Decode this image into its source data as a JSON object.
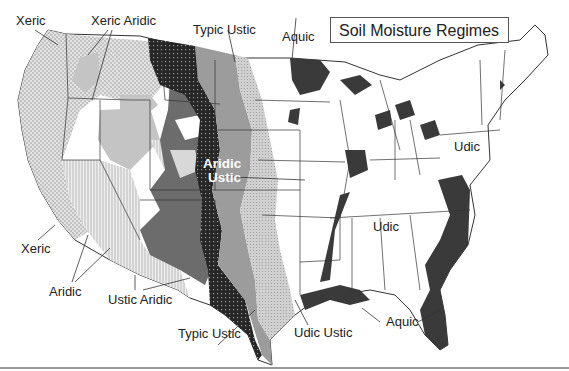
{
  "title": "Soil Moisture Regimes",
  "map": {
    "region": "Contiguous United States",
    "legend_colors": {
      "xeric": "#dcdcdc",
      "xeric_aridic": "#bdbdbd",
      "aridic": "#e6e6e6",
      "ustic_aridic": "#6e6e6e",
      "aridic_ustic": "#2e2e2e",
      "typic_ustic": "#9a9a9a",
      "udic_ustic": "#c8c8c8",
      "udic": "#ffffff",
      "aquic": "#3a3a3a",
      "state_lines": "#333333"
    },
    "labels": [
      {
        "id": "xeric-nw",
        "text": "Xeric"
      },
      {
        "id": "xeric-aridic",
        "text": "Xeric Aridic"
      },
      {
        "id": "typic-ustic-north",
        "text": "Typic Ustic"
      },
      {
        "id": "aquic-north",
        "text": "Aquic"
      },
      {
        "id": "aridic-ustic-1",
        "text": "Aridic"
      },
      {
        "id": "aridic-ustic-2",
        "text": "Ustic"
      },
      {
        "id": "udic-pa",
        "text": "Udic"
      },
      {
        "id": "udic-south",
        "text": "Udic"
      },
      {
        "id": "xeric-ca",
        "text": "Xeric"
      },
      {
        "id": "aridic-sw",
        "text": "Aridic"
      },
      {
        "id": "ustic-aridic",
        "text": "Ustic Aridic"
      },
      {
        "id": "typic-ustic-south",
        "text": "Typic Ustic"
      },
      {
        "id": "udic-ustic",
        "text": "Udic Ustic"
      },
      {
        "id": "aquic-south",
        "text": "Aquic"
      }
    ]
  }
}
